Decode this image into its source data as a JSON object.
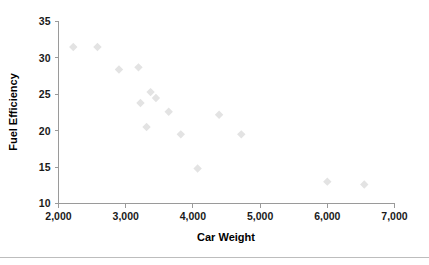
{
  "chart_data": {
    "type": "scatter",
    "title": "",
    "xlabel": "Car Weight",
    "ylabel": "Fuel Efficiency",
    "xlim": [
      2000,
      7000
    ],
    "ylim": [
      10,
      35
    ],
    "xticks": [
      2000,
      3000,
      4000,
      5000,
      6000,
      7000
    ],
    "yticks": [
      10,
      15,
      20,
      25,
      30,
      35
    ],
    "xtick_labels": [
      "2,000",
      "3,000",
      "4,000",
      "5,000",
      "6,000",
      "7,000"
    ],
    "ytick_labels": [
      "10",
      "15",
      "20",
      "25",
      "30",
      "35"
    ],
    "grid": false,
    "legend": null,
    "marker": "diamond",
    "marker_color": "#e3e3e3",
    "points": [
      {
        "x": 2220,
        "y": 31.5
      },
      {
        "x": 2580,
        "y": 31.5
      },
      {
        "x": 2900,
        "y": 28.4
      },
      {
        "x": 3190,
        "y": 28.7
      },
      {
        "x": 3220,
        "y": 23.8
      },
      {
        "x": 3310,
        "y": 20.5
      },
      {
        "x": 3370,
        "y": 25.3
      },
      {
        "x": 3450,
        "y": 24.5
      },
      {
        "x": 3640,
        "y": 22.6
      },
      {
        "x": 3820,
        "y": 19.5
      },
      {
        "x": 4070,
        "y": 14.8
      },
      {
        "x": 4390,
        "y": 22.2
      },
      {
        "x": 4720,
        "y": 19.5
      },
      {
        "x": 6000,
        "y": 13.0
      },
      {
        "x": 6550,
        "y": 12.6
      }
    ]
  },
  "axis_titles": {
    "x": "Car Weight",
    "y": "Fuel Efficiency"
  },
  "colors": {
    "marker": "#e3e3e3",
    "axis": "#9a9a9a",
    "text": "#1a1a1a",
    "rule": "#bdbdbd"
  }
}
